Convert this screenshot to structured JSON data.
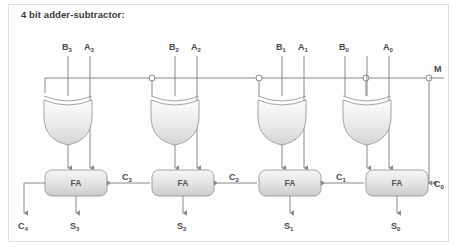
{
  "figure": {
    "title": "4 bit adder-subtractor:",
    "background_color": "#fdfdfd",
    "frame_color": "#dedede",
    "wire_color": "#8a8a8a",
    "gate_fill_top": "#fcfcfc",
    "gate_fill_bottom": "#d7d7d7",
    "box_fill_top": "#f2f2f2",
    "box_fill_bottom": "#cfcfcf",
    "label_color": "#4a4a4a"
  },
  "control": {
    "mode_label": "M",
    "mode_sub": "",
    "bus_note": "mode control line feeding every XOR gate and the first carry-in"
  },
  "stages": [
    {
      "index": 3,
      "b_label": "B",
      "b_sub": "3",
      "a_label": "A",
      "a_sub": "3",
      "fa_label": "FA",
      "sum_label": "S",
      "sum_sub": "3",
      "carry_in_label": "C",
      "carry_in_sub": "3",
      "has_mode_junction": false
    },
    {
      "index": 2,
      "b_label": "B",
      "b_sub": "2",
      "a_label": "A",
      "a_sub": "2",
      "fa_label": "FA",
      "sum_label": "S",
      "sum_sub": "2",
      "carry_in_label": "C",
      "carry_in_sub": "2",
      "has_mode_junction": true
    },
    {
      "index": 1,
      "b_label": "B",
      "b_sub": "1",
      "a_label": "A",
      "a_sub": "1",
      "fa_label": "FA",
      "sum_label": "S",
      "sum_sub": "1",
      "carry_in_label": "C",
      "carry_in_sub": "1",
      "has_mode_junction": true
    },
    {
      "index": 0,
      "b_label": "B",
      "b_sub": "0",
      "a_label": "A",
      "a_sub": "0",
      "fa_label": "FA",
      "sum_label": "S",
      "sum_sub": "0",
      "carry_in_label": "C",
      "carry_in_sub": "0",
      "has_mode_junction": true
    }
  ],
  "carry_out": {
    "label": "C",
    "sub": "4"
  }
}
